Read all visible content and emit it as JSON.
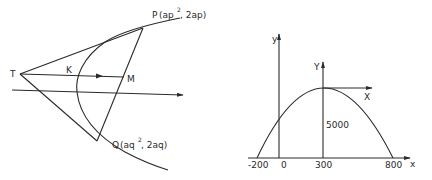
{
  "diagrams": [
    {
      "name": "parabola-tangents",
      "labels": {
        "T": "T",
        "K": "K",
        "M": "M",
        "P": "P",
        "P_coords_a": "(ap",
        "P_coords_sup": "2",
        "P_coords_b": ", 2ap)",
        "Q": "Q",
        "Q_coords_a": "(aq",
        "Q_coords_sup": "2",
        "Q_coords_b": ", 2aq)"
      }
    },
    {
      "name": "projectile-parabola",
      "labels": {
        "y_axis": "y",
        "Y_axis": "Y",
        "X_axis": "X",
        "x_axis": "x",
        "height": "5000",
        "tick_neg200": "-200",
        "tick_0": "0",
        "tick_300": "300",
        "tick_800": "800"
      }
    }
  ],
  "colors": {
    "ink": "#2a2a2a",
    "background": "#ffffff"
  }
}
